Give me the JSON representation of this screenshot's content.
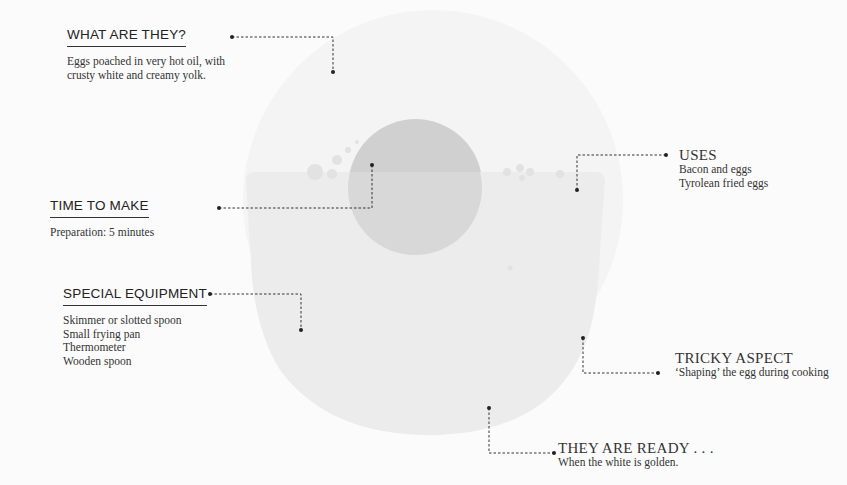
{
  "colors": {
    "background": "#fbfbfb",
    "egg_white_top": "#f6f6f6",
    "pan_body": "#ececec",
    "yolk": "#d6d6d6",
    "leader": "#333333"
  },
  "sections": {
    "what_are_they": {
      "heading": "WHAT ARE THEY?",
      "lines": [
        "Eggs poached in very hot oil, with",
        "crusty white and creamy yolk."
      ]
    },
    "time_to_make": {
      "heading": "TIME TO MAKE",
      "lines": [
        "Preparation: 5 minutes"
      ]
    },
    "special_equipment": {
      "heading": "SPECIAL EQUIPMENT",
      "lines": [
        "Skimmer or slotted spoon",
        "Small frying pan",
        "Thermometer",
        "Wooden spoon"
      ]
    },
    "uses": {
      "heading": "USES",
      "lines": [
        "Bacon and eggs",
        "Tyrolean fried eggs"
      ]
    },
    "tricky_aspect": {
      "heading": "TRICKY ASPECT",
      "lines": [
        "‘Shaping’ the egg during cooking"
      ]
    },
    "they_are_ready": {
      "heading": "THEY ARE READY . . .",
      "lines": [
        "When the white is golden."
      ]
    }
  }
}
